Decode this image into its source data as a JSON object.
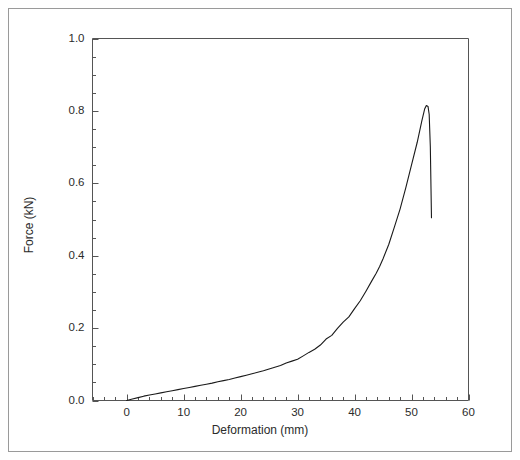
{
  "figure": {
    "background_color": "#ffffff",
    "border_color": "#9a9a9a",
    "axis_color": "#555555",
    "curve_color": "#1a1a1a"
  },
  "chart_data": {
    "type": "line",
    "title": "",
    "xlabel": "Deformation (mm)",
    "ylabel": "Force (kN)",
    "xlim": [
      -6,
      60
    ],
    "ylim": [
      0.0,
      1.0
    ],
    "grid": false,
    "legend": null,
    "xticks": [
      0,
      10,
      20,
      30,
      40,
      50,
      60
    ],
    "xtick_labels": [
      "0",
      "10",
      "20",
      "30",
      "40",
      "50",
      "60"
    ],
    "x_minor_step": 2,
    "yticks": [
      0.0,
      0.2,
      0.4,
      0.6,
      0.8,
      1.0
    ],
    "ytick_labels": [
      "0.0",
      "0.2",
      "0.4",
      "0.6",
      "0.8",
      "1.0"
    ],
    "y_minor_step": 0.05,
    "series": [
      {
        "name": "Force-Deformation",
        "x": [
          0.0,
          1.0,
          2.0,
          3.0,
          4.0,
          5.0,
          6.0,
          7.0,
          8.0,
          9.0,
          10.0,
          11.0,
          12.0,
          13.0,
          14.0,
          15.0,
          16.0,
          17.0,
          18.0,
          19.0,
          20.0,
          21.0,
          22.0,
          23.0,
          24.0,
          25.0,
          26.0,
          27.0,
          28.0,
          29.0,
          30.0,
          31.0,
          32.0,
          33.0,
          34.0,
          35.0,
          36.0,
          37.0,
          38.0,
          39.0,
          40.0,
          41.0,
          42.0,
          43.0,
          43.8,
          44.4,
          45.0,
          46.0,
          47.0,
          48.0,
          49.0,
          50.0,
          51.0,
          51.8,
          52.3,
          52.6,
          52.9,
          53.1,
          53.3,
          53.5
        ],
        "y": [
          0.0,
          0.004,
          0.008,
          0.012,
          0.015,
          0.018,
          0.021,
          0.024,
          0.027,
          0.03,
          0.033,
          0.036,
          0.039,
          0.042,
          0.045,
          0.048,
          0.052,
          0.055,
          0.058,
          0.062,
          0.066,
          0.07,
          0.074,
          0.078,
          0.082,
          0.087,
          0.092,
          0.097,
          0.103,
          0.109,
          0.116,
          0.124,
          0.133,
          0.143,
          0.155,
          0.168,
          0.182,
          0.198,
          0.215,
          0.233,
          0.252,
          0.275,
          0.3,
          0.328,
          0.352,
          0.372,
          0.393,
          0.432,
          0.478,
          0.53,
          0.588,
          0.65,
          0.715,
          0.77,
          0.805,
          0.815,
          0.812,
          0.79,
          0.7,
          0.505
        ]
      }
    ],
    "annotations": {
      "peak_force": 0.815,
      "peak_deformation": 52.6,
      "final_force": 0.505,
      "final_deformation": 53.5
    }
  }
}
